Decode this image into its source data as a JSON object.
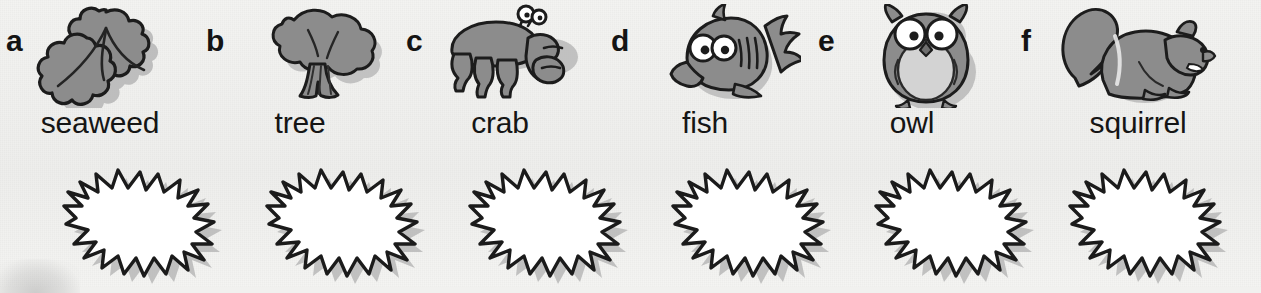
{
  "page": {
    "background_color": "#f1f1ef",
    "ink_color": "#141414",
    "fill_gray": "#8a8a8a",
    "shadow_gray": "#b4b4b4"
  },
  "items": [
    {
      "letter": "a",
      "label": "seaweed",
      "icon": "seaweed-icon",
      "x": 0
    },
    {
      "letter": "b",
      "label": "tree",
      "icon": "tree-icon",
      "x": 200
    },
    {
      "letter": "c",
      "label": "crab",
      "icon": "crab-icon",
      "x": 400
    },
    {
      "letter": "d",
      "label": "fish",
      "icon": "fish-icon",
      "x": 605
    },
    {
      "letter": "e",
      "label": "owl",
      "icon": "owl-icon",
      "x": 812
    },
    {
      "letter": "f",
      "label": "squirrel",
      "icon": "squirrel-icon",
      "x": 1015
    }
  ],
  "answer_boxes": [
    {
      "index": 1,
      "for_letter": "a",
      "value": "",
      "x": 52
    },
    {
      "index": 2,
      "for_letter": "b",
      "value": "",
      "x": 255
    },
    {
      "index": 3,
      "for_letter": "c",
      "value": "",
      "x": 458
    },
    {
      "index": 4,
      "for_letter": "d",
      "value": "",
      "x": 661
    },
    {
      "index": 5,
      "for_letter": "e",
      "value": "",
      "x": 864
    },
    {
      "index": 6,
      "for_letter": "f",
      "value": "",
      "x": 1058
    }
  ],
  "decoration": {
    "corner_smudge": "page-edge-smudge"
  }
}
